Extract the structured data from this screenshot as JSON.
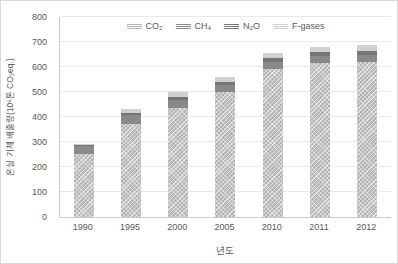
{
  "figure": {
    "background": "#ffffff",
    "border_color": "#d9d9d9",
    "text_color": "#595959",
    "gridline_color": "#e9e9e9",
    "axis_line_color": "#c9c9c9"
  },
  "chart_data": {
    "type": "bar",
    "stacked": true,
    "title": "",
    "xlabel": "년도",
    "ylabel": "온실 기체 배출량(10⁶톤 CO₂eq.)",
    "ylim": [
      0,
      800
    ],
    "yticks": [
      0,
      100,
      200,
      300,
      400,
      500,
      600,
      700,
      800
    ],
    "grid": true,
    "legend_position": "top-center",
    "categories": [
      "1990",
      "1995",
      "2000",
      "2005",
      "2010",
      "2011",
      "2012"
    ],
    "series": [
      {
        "name": "CO₂",
        "color": "#b3b3b3",
        "hatch": true,
        "values": [
          252,
          373,
          438,
          500,
          594,
          616,
          622
        ]
      },
      {
        "name": "CH₄",
        "color": "#898989",
        "hatch": false,
        "values": [
          31,
          35,
          30,
          28,
          28,
          28,
          28
        ]
      },
      {
        "name": "N₂O",
        "color": "#757575",
        "hatch": false,
        "values": [
          7,
          10,
          13,
          14,
          14,
          15,
          15
        ]
      },
      {
        "name": "F-gases",
        "color": "#d0d0d0",
        "hatch": false,
        "values": [
          2,
          14,
          20,
          17,
          21,
          23,
          24
        ]
      }
    ],
    "totals": [
      292,
      432,
      501,
      559,
      657,
      682,
      689
    ]
  }
}
